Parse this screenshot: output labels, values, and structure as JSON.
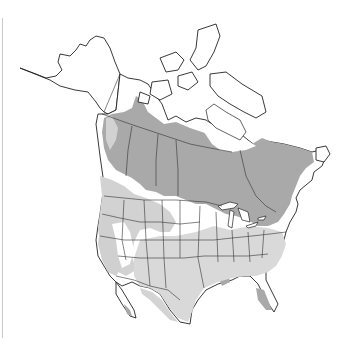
{
  "map": {
    "subject": "North America range map",
    "region": "North America",
    "legend_colors": {
      "core_range": "#a9a9a9",
      "secondary_range": "#d2d2d2",
      "sparse_range": "#e6e6e6",
      "outside_range": "#ffffff",
      "boundary_lines": "#222222"
    }
  }
}
